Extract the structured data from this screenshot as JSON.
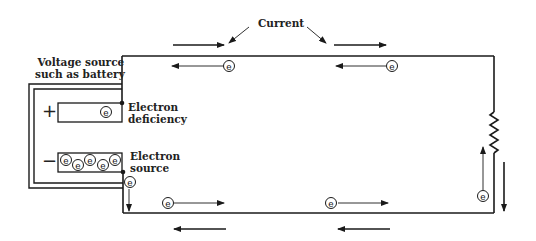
{
  "diagram": {
    "type": "electric circuit - electron flow vs conventional current",
    "labels": {
      "current": "Current",
      "voltage_source_line1": "Voltage source",
      "voltage_source_line2": "such as battery",
      "electron_deficiency_line1": "Electron",
      "electron_deficiency_line2": "deficiency",
      "electron_source_line1": "Electron",
      "electron_source_line2": "source",
      "plus_sign": "+",
      "minus_sign": "−"
    },
    "electron_symbol": "e",
    "components": [
      "voltage source (battery)",
      "wire loop",
      "resistor"
    ],
    "arrows": {
      "current_direction": "clockwise (conventional current: top wire left-to-right, right wire downward, bottom wire right-to-left)",
      "electron_direction": "counter-clockwise (electron flow: top wire right-to-left, bottom wire left-to-right, right wire upward)"
    },
    "colors": {
      "line": "#1a1a1a",
      "background": "#ffffff"
    }
  }
}
